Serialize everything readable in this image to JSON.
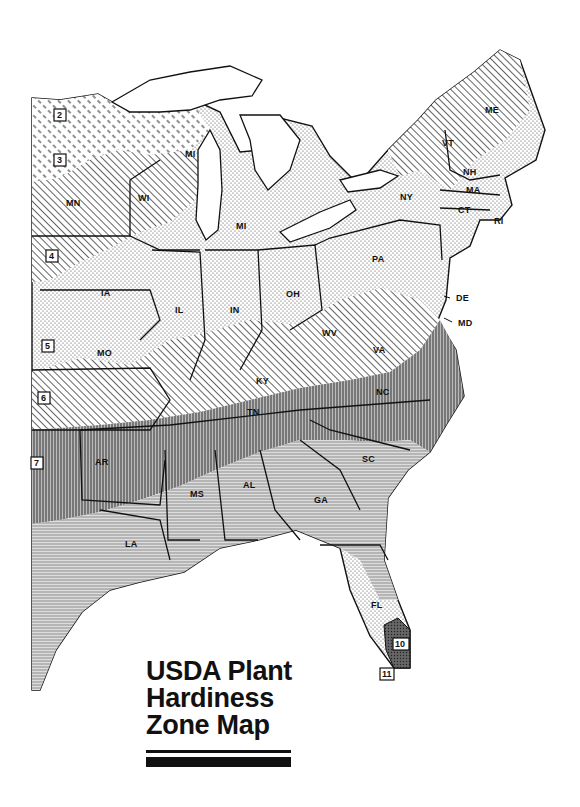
{
  "title": {
    "line1": "USDA Plant",
    "line2": "Hardiness",
    "line3": "Zone Map"
  },
  "map": {
    "region": "Eastern United States",
    "style": "black-and-white hatched zone map",
    "colors": {
      "ink": "#111111",
      "paper": "#ffffff",
      "zone_fill_light": "#e6e6e6",
      "zone_fill_mid": "#b9b9b9",
      "zone_fill_dark": "#8c8c8c"
    },
    "zones": [
      {
        "number": "2",
        "x": 60,
        "y": 117
      },
      {
        "number": "3",
        "x": 60,
        "y": 162
      },
      {
        "number": "4",
        "x": 52,
        "y": 258
      },
      {
        "number": "5",
        "x": 48,
        "y": 348
      },
      {
        "number": "6",
        "x": 44,
        "y": 400
      },
      {
        "number": "7",
        "x": 37,
        "y": 465
      },
      {
        "number": "10",
        "x": 400,
        "y": 646
      },
      {
        "number": "11",
        "x": 385,
        "y": 672
      }
    ],
    "states": [
      {
        "abbr": "MN",
        "x": 72,
        "y": 206
      },
      {
        "abbr": "WI",
        "x": 143,
        "y": 201
      },
      {
        "abbr": "MI",
        "x": 189,
        "y": 157
      },
      {
        "abbr": "MI",
        "x": 241,
        "y": 229
      },
      {
        "abbr": "IA",
        "x": 105,
        "y": 296
      },
      {
        "abbr": "IL",
        "x": 178,
        "y": 313
      },
      {
        "abbr": "IN",
        "x": 235,
        "y": 313
      },
      {
        "abbr": "OH",
        "x": 292,
        "y": 297
      },
      {
        "abbr": "PA",
        "x": 377,
        "y": 262
      },
      {
        "abbr": "NY",
        "x": 406,
        "y": 200
      },
      {
        "abbr": "VT",
        "x": 447,
        "y": 146
      },
      {
        "abbr": "NH",
        "x": 468,
        "y": 175
      },
      {
        "abbr": "ME",
        "x": 490,
        "y": 113
      },
      {
        "abbr": "MA",
        "x": 472,
        "y": 193
      },
      {
        "abbr": "CT",
        "x": 463,
        "y": 213
      },
      {
        "abbr": "RI",
        "x": 496,
        "y": 221
      },
      {
        "abbr": "DE",
        "x": 452,
        "y": 298
      },
      {
        "abbr": "MD",
        "x": 456,
        "y": 323
      },
      {
        "abbr": "WV",
        "x": 329,
        "y": 336
      },
      {
        "abbr": "VA",
        "x": 378,
        "y": 353
      },
      {
        "abbr": "MO",
        "x": 103,
        "y": 356
      },
      {
        "abbr": "KY",
        "x": 262,
        "y": 384
      },
      {
        "abbr": "TN",
        "x": 252,
        "y": 415
      },
      {
        "abbr": "NC",
        "x": 382,
        "y": 395
      },
      {
        "abbr": "SC",
        "x": 368,
        "y": 462
      },
      {
        "abbr": "AR",
        "x": 101,
        "y": 465
      },
      {
        "abbr": "MS",
        "x": 196,
        "y": 497
      },
      {
        "abbr": "AL",
        "x": 248,
        "y": 488
      },
      {
        "abbr": "GA",
        "x": 320,
        "y": 503
      },
      {
        "abbr": "LA",
        "x": 130,
        "y": 547
      },
      {
        "abbr": "FL",
        "x": 376,
        "y": 608
      }
    ]
  }
}
